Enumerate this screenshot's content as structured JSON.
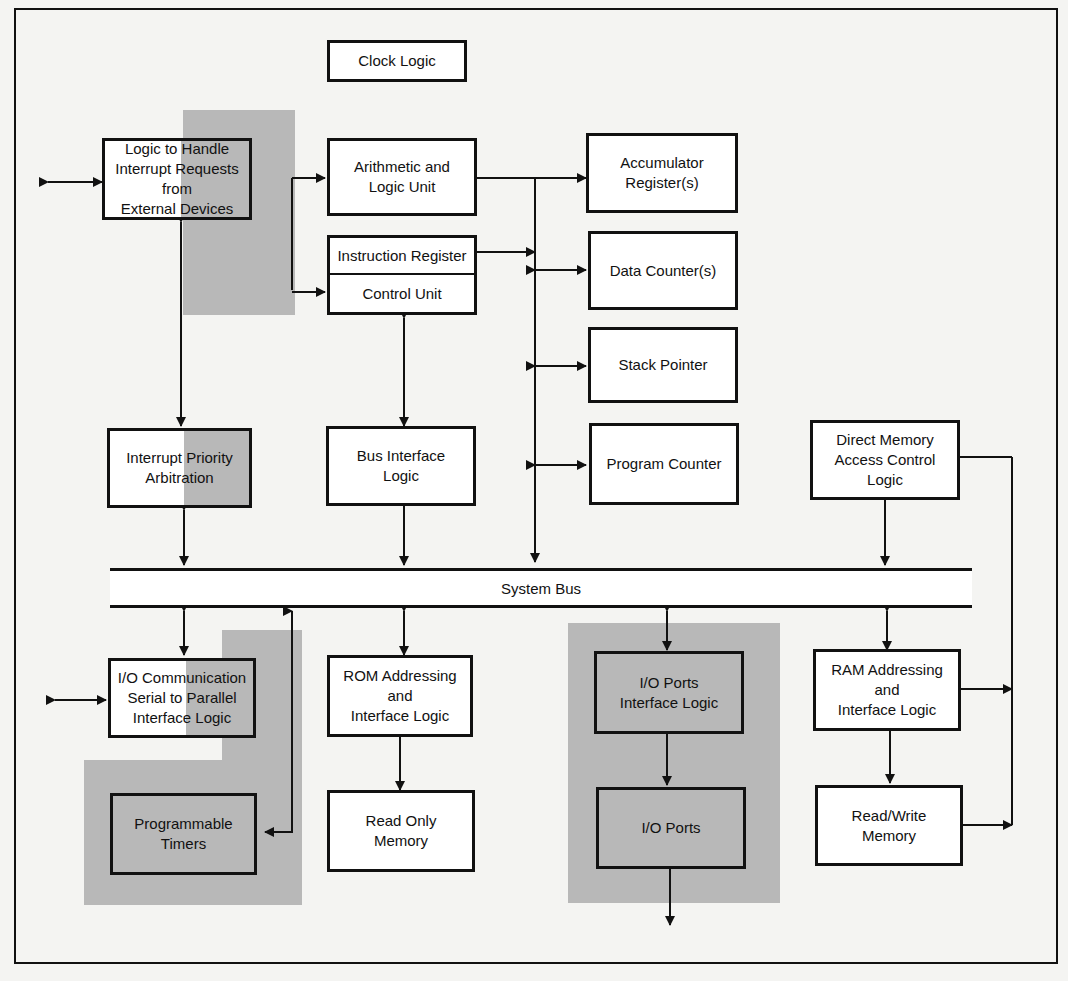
{
  "figure": {
    "shade_color": "#b8b8b8",
    "line_color": "#111111"
  },
  "blocks": {
    "clock_logic": "Clock Logic",
    "interrupt_handler": "Logic to Handle\nInterrupt Requests\nfrom\nExternal Devices",
    "alu": "Arithmetic and\nLogic Unit",
    "accumulator": "Accumulator\nRegister(s)",
    "instruction_register": "Instruction Register",
    "control_unit": "Control Unit",
    "data_counter": "Data Counter(s)",
    "stack_pointer": "Stack Pointer",
    "interrupt_priority": "Interrupt Priority\nArbitration",
    "bus_interface": "Bus Interface\nLogic",
    "program_counter": "Program Counter",
    "dma_control": "Direct Memory\nAccess Control\nLogic",
    "system_bus": "System Bus",
    "io_communication": "I/O Communication\nSerial to Parallel\nInterface Logic",
    "rom_addressing": "ROM Addressing\nand\nInterface Logic",
    "io_ports_interface": "I/O Ports\nInterface Logic",
    "ram_addressing": "RAM Addressing\nand\nInterface Logic",
    "programmable_timers": "Programmable\nTimers",
    "read_only_memory": "Read Only\nMemory",
    "io_ports": "I/O Ports",
    "read_write_memory": "Read/Write\nMemory"
  }
}
